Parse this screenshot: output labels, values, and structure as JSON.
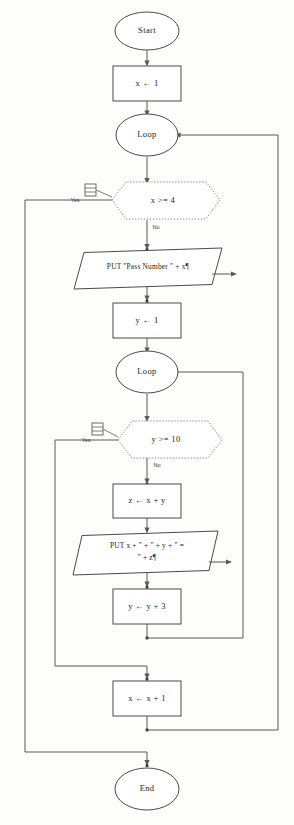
{
  "diagram": {
    "type": "flowchart",
    "colors": {
      "background": "#fdfdfc",
      "node_stroke": "#4a4a4a",
      "decision_stroke": "#8a8a8a",
      "connector": "#595959",
      "text": "#1d1d1d"
    }
  },
  "nodes": {
    "start": {
      "label": "Start",
      "shape": "terminator"
    },
    "init_x": {
      "label": "x ← 1",
      "shape": "process"
    },
    "outer_loop": {
      "label": "Loop",
      "shape": "terminator"
    },
    "outer_cond": {
      "label": "x >= 4",
      "shape": "decision"
    },
    "put_pass": {
      "label": "PUT \"Pass Number \" + x¶",
      "shape": "output"
    },
    "init_y": {
      "label": "y ← 1",
      "shape": "process"
    },
    "inner_loop": {
      "label": "Loop",
      "shape": "terminator"
    },
    "inner_cond": {
      "label": "y >= 10",
      "shape": "decision"
    },
    "calc_z": {
      "label": "z ← x + y",
      "shape": "process"
    },
    "put_sum_line1": {
      "label": "PUT x + \" + \" + y + \" =",
      "shape": "output"
    },
    "put_sum_line2": {
      "label": "\" + z¶",
      "shape": "output"
    },
    "inc_y": {
      "label": "y ← y + 3",
      "shape": "process"
    },
    "inc_x": {
      "label": "x ← x + 1",
      "shape": "process"
    },
    "end": {
      "label": "End",
      "shape": "terminator"
    }
  },
  "branch_labels": {
    "outer_yes": "Yes",
    "outer_no": "No",
    "inner_yes": "Yes",
    "inner_no": "No"
  },
  "annotations": {
    "outer_note": "note-icon",
    "inner_note": "note-icon"
  }
}
